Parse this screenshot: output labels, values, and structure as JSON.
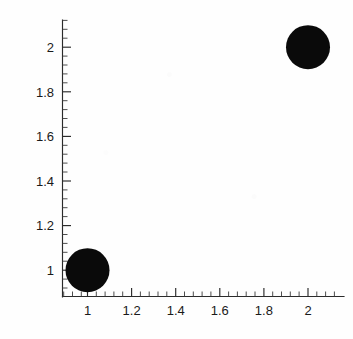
{
  "figure": {
    "title": "",
    "background_color": "#fefefe",
    "marker_color": "#0a0a0a",
    "axis_color": "#2b2b2b"
  },
  "chart_data": {
    "type": "scatter",
    "title": "",
    "xlabel": "",
    "ylabel": "",
    "xlim": [
      0.89,
      2.09
    ],
    "ylim": [
      0.885,
      2.085
    ],
    "grid": false,
    "legend": null,
    "marker_style": "filled-circle",
    "marker_size_px": 44,
    "points": [
      {
        "x": 1,
        "y": 1
      },
      {
        "x": 2,
        "y": 2
      }
    ],
    "series": [
      {
        "name": "points",
        "x": [
          1,
          2
        ],
        "y": [
          1,
          2
        ],
        "color": "#0a0a0a"
      }
    ],
    "x_major_ticks": [
      1,
      1.2,
      1.4,
      1.6,
      1.8,
      2
    ],
    "x_tick_labels": [
      "1",
      "1.2",
      "1.4",
      "1.6",
      "1.8",
      "2"
    ],
    "y_major_ticks": [
      1,
      1.2,
      1.4,
      1.6,
      1.8,
      2
    ],
    "y_tick_labels": [
      "1",
      "1.2",
      "1.4",
      "1.6",
      "1.8",
      "2"
    ],
    "minor_ticks_per_interval": 4
  },
  "axes": {
    "x": {
      "labels": [
        "1",
        "1.2",
        "1.4",
        "1.6",
        "1.8",
        "2"
      ]
    },
    "y": {
      "labels": [
        "2",
        "1.8",
        "1.6",
        "1.4",
        "1.2",
        "1"
      ]
    }
  }
}
